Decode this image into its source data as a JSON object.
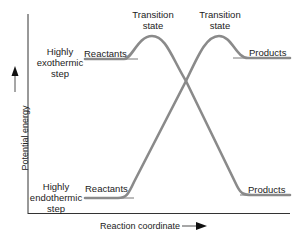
{
  "diagram": {
    "axes": {
      "y_label": "Potential energy",
      "x_label": "Reaction coordinate"
    },
    "steps": {
      "exothermic": {
        "label_line1": "Highly",
        "label_line2": "exothermic",
        "label_line3": "step",
        "reactants": "Reactants",
        "transition_line1": "Transition",
        "transition_line2": "state",
        "products": "Products"
      },
      "endothermic": {
        "label_line1": "Highly",
        "label_line2": "endothermic",
        "label_line3": "step",
        "reactants": "Reactants",
        "transition_line1": "Transition",
        "transition_line2": "state",
        "products": "Products"
      }
    },
    "colors": {
      "curve": "#8a8a8a",
      "axis": "#333333",
      "text": "#222222"
    }
  }
}
